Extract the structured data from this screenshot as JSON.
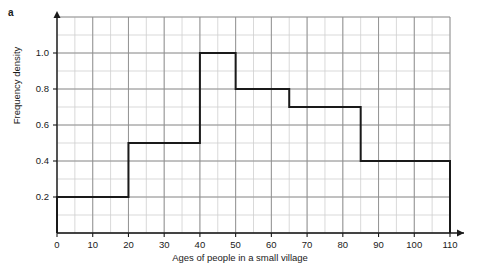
{
  "panel": {
    "label": "a"
  },
  "chart_data": {
    "type": "bar",
    "subtype": "histogram",
    "title": "",
    "xlabel": "Ages of people in a small village",
    "ylabel": "Frequency density",
    "xlim": [
      0,
      110
    ],
    "ylim": [
      0,
      1.2
    ],
    "grid": true,
    "grid_major_x": 10,
    "grid_minor_x": 5,
    "grid_major_y": 0.2,
    "grid_minor_y": 0.1,
    "legend": "none",
    "xticks": [
      0,
      10,
      20,
      30,
      40,
      50,
      60,
      70,
      80,
      90,
      100,
      110
    ],
    "xticklabels": [
      "0",
      "10",
      "20",
      "30",
      "40",
      "50",
      "60",
      "70",
      "80",
      "90",
      "100",
      "110"
    ],
    "yticks": [
      0.2,
      0.4,
      0.6,
      0.8,
      1.0
    ],
    "yticklabels": [
      "0.2",
      "0.4",
      "0.6",
      "0.8",
      "1.0"
    ],
    "bin_edges": [
      0,
      20,
      40,
      50,
      65,
      85,
      110
    ],
    "values": [
      0.2,
      0.5,
      1.0,
      0.8,
      0.7,
      0.4
    ],
    "bars": [
      {
        "x0": 0,
        "x1": 20,
        "density": 0.2,
        "width": 20,
        "frequency": 4
      },
      {
        "x0": 20,
        "x1": 40,
        "density": 0.5,
        "width": 20,
        "frequency": 10
      },
      {
        "x0": 40,
        "x1": 50,
        "density": 1.0,
        "width": 10,
        "frequency": 10
      },
      {
        "x0": 50,
        "x1": 65,
        "density": 0.8,
        "width": 15,
        "frequency": 12
      },
      {
        "x0": 65,
        "x1": 85,
        "density": 0.7,
        "width": 20,
        "frequency": 14
      },
      {
        "x0": 85,
        "x1": 110,
        "density": 0.4,
        "width": 25,
        "frequency": 10
      }
    ],
    "colors": {
      "outline": "#1a1a1a",
      "fill": "none",
      "grid_major": "#8c8c8c",
      "grid_minor": "#cfcfcf",
      "axis": "#1a1a1a",
      "text": "#1a1a1a",
      "background": "#ffffff"
    }
  }
}
